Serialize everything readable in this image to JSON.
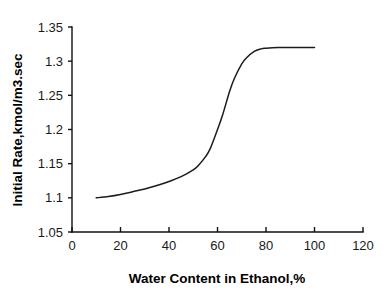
{
  "chart_data": {
    "type": "line",
    "title": "",
    "xlabel": "Water Content in Ethanol,%",
    "ylabel": "Initial Rate,kmol/m3.sec",
    "xlim": [
      0,
      120
    ],
    "ylim": [
      1.05,
      1.35
    ],
    "xticks": [
      0,
      20,
      40,
      60,
      80,
      100,
      120
    ],
    "xtick_labels": [
      "0",
      "20",
      "40",
      "60",
      "80",
      "100",
      "120"
    ],
    "yticks": [
      1.05,
      1.1,
      1.15,
      1.2,
      1.25,
      1.3,
      1.35
    ],
    "ytick_labels": [
      "1.05",
      "1.1",
      "1.15",
      "1.2",
      "1.25",
      "1.3",
      "1.35"
    ],
    "grid": false,
    "legend": false,
    "series": [
      {
        "name": "Initial Rate",
        "color": "#1c1c1c",
        "x": [
          10,
          15,
          20,
          25,
          30,
          35,
          40,
          45,
          50,
          52,
          55,
          57,
          60,
          62,
          65,
          67,
          70,
          72,
          75,
          78,
          80,
          85,
          90,
          95,
          100
        ],
        "values": [
          1.1,
          1.102,
          1.105,
          1.109,
          1.113,
          1.118,
          1.124,
          1.131,
          1.141,
          1.147,
          1.16,
          1.172,
          1.2,
          1.22,
          1.256,
          1.275,
          1.296,
          1.305,
          1.314,
          1.318,
          1.319,
          1.32,
          1.32,
          1.32,
          1.32
        ]
      }
    ]
  },
  "axes": {
    "x_title": "Water Content in Ethanol,%",
    "y_title": "Initial Rate,kmol/m3.sec"
  }
}
